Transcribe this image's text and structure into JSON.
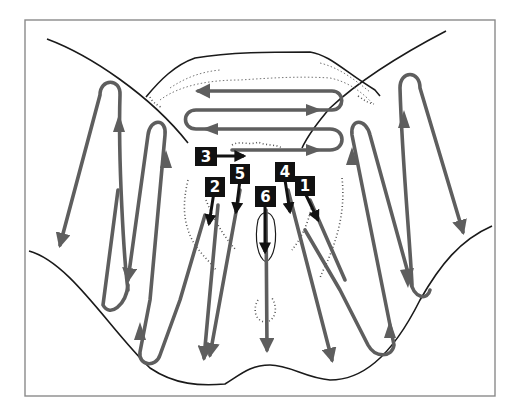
{
  "diagram": {
    "type": "massage-stroke-direction-diagram",
    "colors": {
      "frame": "#8a8a8a",
      "outline": "#1a1a1a",
      "stroke_arrows": "#5e5e5e",
      "marker_boxes": "#111111",
      "marker_text": "#ffffff",
      "background": "#ffffff"
    },
    "markers": [
      {
        "id": "1",
        "label": "1"
      },
      {
        "id": "2",
        "label": "2"
      },
      {
        "id": "3",
        "label": "3"
      },
      {
        "id": "4",
        "label": "4"
      },
      {
        "id": "5",
        "label": "5"
      },
      {
        "id": "6",
        "label": "6"
      }
    ],
    "stroke_groups": [
      {
        "name": "top-zigzag",
        "direction": "horizontal serpentine, left-right alternating"
      },
      {
        "name": "left-outer-loop",
        "direction": "up then down"
      },
      {
        "name": "left-inner-loop",
        "direction": "up then down"
      },
      {
        "name": "right-outer-loop",
        "direction": "up then down"
      },
      {
        "name": "right-inner-loop",
        "direction": "up then down"
      },
      {
        "name": "center-downward-strokes",
        "direction": "downward"
      }
    ]
  }
}
